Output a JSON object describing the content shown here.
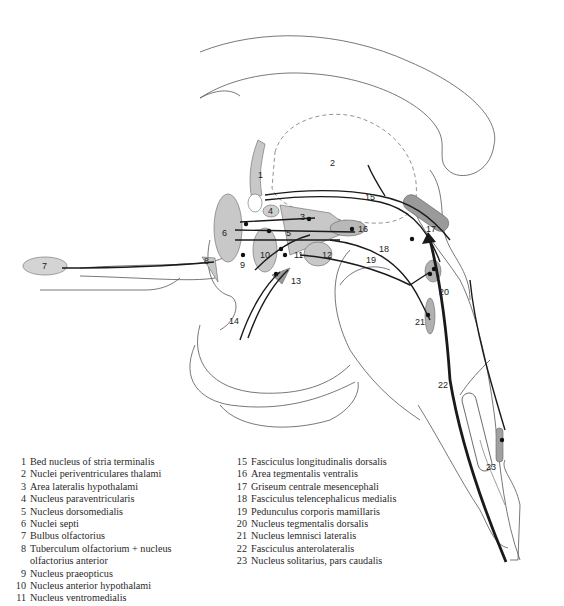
{
  "diagram": {
    "type": "neuroanatomy sagittal section",
    "labels": {
      "n1": "1",
      "n2": "2",
      "n3": "3",
      "n4": "4",
      "n5": "5",
      "n6": "6",
      "n7": "7",
      "n8": "8",
      "n9": "9",
      "n10": "10",
      "n11": "11",
      "n12": "12",
      "n13": "13",
      "n14": "14",
      "n15": "15",
      "n16": "16",
      "n17": "17",
      "n18": "18",
      "n19": "19",
      "n20": "20",
      "n21": "21",
      "n22": "22",
      "n23": "23"
    },
    "colors": {
      "nucleus_fill": "#c8c8c8",
      "dark_nucleus_fill": "#9a9a9a",
      "line": "#1a1a1a",
      "outline": "#555555"
    }
  },
  "legend": {
    "left": [
      {
        "num": "1",
        "text": "Bed nucleus of stria terminalis"
      },
      {
        "num": "2",
        "text": "Nuclei periventriculares thalami"
      },
      {
        "num": "3",
        "text": "Area lateralis hypothalami"
      },
      {
        "num": "4",
        "text": "Nucleus paraventricularis"
      },
      {
        "num": "5",
        "text": "Nucleus dorsomedialis"
      },
      {
        "num": "6",
        "text": "Nuclei septi"
      },
      {
        "num": "7",
        "text": "Bulbus olfactorius"
      },
      {
        "num": "8",
        "text": "Tuberculum olfactorium + nucleus",
        "cont": "olfactorius anterior"
      },
      {
        "num": "9",
        "text": "Nucleus praeopticus"
      },
      {
        "num": "10",
        "text": "Nucleus anterior hypothalami"
      },
      {
        "num": "11",
        "text": "Nucleus ventromedialis"
      }
    ],
    "right": [
      {
        "num": "15",
        "text": "Fasciculus longitudinalis dorsalis"
      },
      {
        "num": "16",
        "text": "Area tegmentalis ventralis"
      },
      {
        "num": "17",
        "text": "Griseum centrale mesencephali"
      },
      {
        "num": "18",
        "text": "Fasciculus telencephalicus medialis"
      },
      {
        "num": "19",
        "text": "Pedunculus corporis mamillaris"
      },
      {
        "num": "20",
        "text": "Nucleus tegmentalis dorsalis"
      },
      {
        "num": "21",
        "text": "Nucleus lemnisci lateralis"
      },
      {
        "num": "22",
        "text": "Fasciculus anterolateralis"
      },
      {
        "num": "23",
        "text": "Nucleus solitarius, pars caudalis"
      }
    ]
  }
}
